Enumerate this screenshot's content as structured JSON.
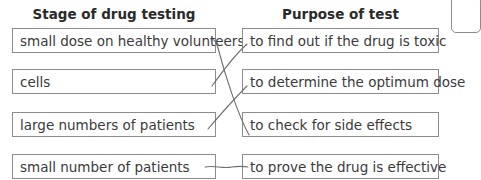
{
  "headings": {
    "left": "Stage of drug testing",
    "right": "Purpose of test"
  },
  "stages": [
    "small dose on healthy volunteers",
    "cells",
    "large numbers of patients",
    "small number of patients"
  ],
  "purposes": [
    "to find out if the drug is toxic",
    "to determine the optimum dose",
    "to check for side effects",
    "to prove the drug is effective"
  ],
  "connections": [
    {
      "from_stage": "small dose on healthy volunteers",
      "to_purpose": "to check for side effects"
    },
    {
      "from_stage": "cells",
      "to_purpose": "to find out if the drug is toxic"
    },
    {
      "from_stage": "large numbers of patients",
      "to_purpose": "to determine the optimum dose"
    },
    {
      "from_stage": "small number of patients",
      "to_purpose": "to prove the drug is effective"
    }
  ],
  "colors": {
    "border": "#8c8c8c",
    "text": "#3a3a3a",
    "line": "#6e6e6e"
  }
}
